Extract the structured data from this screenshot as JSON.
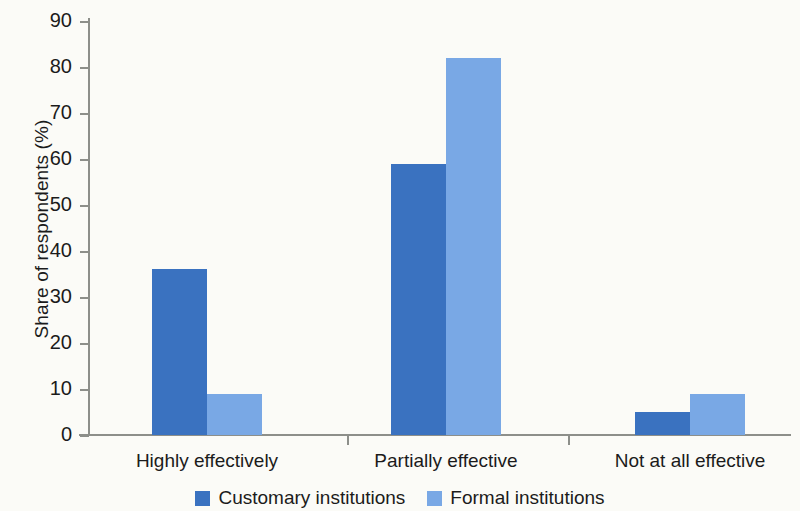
{
  "chart_data": {
    "type": "bar",
    "title": "",
    "subtitle": "",
    "xlabel": "",
    "ylabel": "Share of respondents (%)",
    "categories": [
      "Highly effectively",
      "Partially effective",
      "Not at all effective"
    ],
    "series": [
      {
        "name": "Customary institutions",
        "color": "#3a72c0",
        "values": [
          36,
          59,
          5
        ]
      },
      {
        "name": "Formal institutions",
        "color": "#79a8e5",
        "values": [
          9,
          82,
          9
        ]
      }
    ],
    "ylim": [
      0,
      90
    ],
    "ytick_step": 10,
    "ytick_labels": [
      "0",
      "10",
      "20",
      "30",
      "40",
      "50",
      "60",
      "70",
      "80",
      "90"
    ],
    "grid": false,
    "legend_position": "bottom",
    "background_color": "#fbfbf7",
    "axis_color": "#8d8f8a"
  },
  "legend": {
    "items": [
      {
        "label": "Customary institutions",
        "color": "#3a72c0"
      },
      {
        "label": "Formal institutions",
        "color": "#79a8e5"
      }
    ]
  }
}
